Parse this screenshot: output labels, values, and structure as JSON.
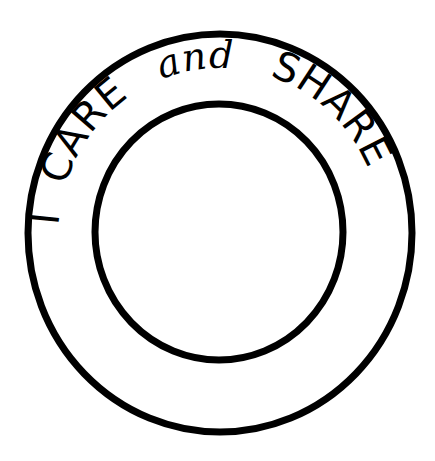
{
  "artwork": {
    "title": "I CARE and SHARE badge",
    "ring_text": {
      "word_1": "I",
      "word_2": "CARE",
      "word_3": "and",
      "word_4": "SHARE"
    },
    "colors": {
      "ink": "#000000",
      "background": "#ffffff"
    }
  }
}
